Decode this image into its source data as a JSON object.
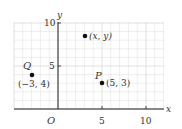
{
  "figure": {
    "axes": {
      "x_label": "x",
      "y_label": "y",
      "origin_label": "O",
      "x_ticks": [
        {
          "value": 5,
          "label": "5"
        },
        {
          "value": 10,
          "label": "10"
        }
      ],
      "y_ticks": [
        {
          "value": 5,
          "label": "5"
        },
        {
          "value": 10,
          "label": "10"
        }
      ],
      "x_range": [
        -4,
        11
      ],
      "y_range": [
        0,
        10
      ],
      "grid": true
    },
    "points": [
      {
        "name": "generic",
        "label": "(x, y)",
        "x": 3,
        "y": 8.5
      },
      {
        "name": "Q",
        "letter": "Q",
        "label": "(−3, 4)",
        "x": -3,
        "y": 4
      },
      {
        "name": "P",
        "letter": "P",
        "label": "(5, 3)",
        "x": 5,
        "y": 3
      }
    ],
    "colors": {
      "grid": "#dcdcdc",
      "axis": "#222222",
      "point": "#111111",
      "text": "#333333"
    }
  },
  "chart_data": {
    "type": "scatter",
    "title": "",
    "xlabel": "x",
    "ylabel": "y",
    "xlim": [
      -4,
      11
    ],
    "ylim": [
      0,
      10
    ],
    "grid": true,
    "x_ticks": [
      5,
      10
    ],
    "y_ticks": [
      5,
      10
    ],
    "points": [
      {
        "label": "(x, y)",
        "x": 3,
        "y": 8.5
      },
      {
        "label": "Q (-3, 4)",
        "x": -3,
        "y": 4
      },
      {
        "label": "P (5, 3)",
        "x": 5,
        "y": 3
      }
    ],
    "annotations": [
      "O",
      "Q",
      "P",
      "(x, y)",
      "(-3, 4)",
      "(5, 3)"
    ]
  }
}
